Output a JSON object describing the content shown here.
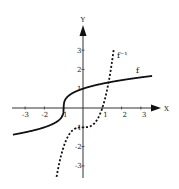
{
  "chart_data": {
    "type": "line",
    "title": "",
    "xlabel": "X",
    "ylabel": "Y",
    "xlim": [
      -3.7,
      3.9
    ],
    "ylim": [
      -3.7,
      4.4
    ],
    "grid": false,
    "x_ticks": [
      -3,
      -2,
      -1,
      1,
      2,
      3
    ],
    "y_ticks": [
      -3,
      -2,
      -1,
      1,
      2,
      3
    ],
    "x_tick_labels": [
      "-3",
      "-2",
      "-1",
      "1",
      "2",
      "3"
    ],
    "y_tick_labels": [
      "-3",
      "-2",
      "-1",
      "1",
      "2",
      "3"
    ],
    "series": [
      {
        "name": "f",
        "label": "f",
        "style": "solid",
        "formula": "cbrt(x + 1)",
        "x_range": [
          -3.63,
          3.58
        ],
        "points": [
          [
            -3.6,
            -1.37
          ],
          [
            -3,
            -1.26
          ],
          [
            -2,
            -1
          ],
          [
            -1.5,
            -0.79
          ],
          [
            -1.1,
            -0.46
          ],
          [
            -1,
            0
          ],
          [
            -0.9,
            0.46
          ],
          [
            -0.5,
            0.79
          ],
          [
            0,
            1
          ],
          [
            1,
            1.26
          ],
          [
            2,
            1.44
          ],
          [
            3,
            1.59
          ],
          [
            3.58,
            1.66
          ]
        ]
      },
      {
        "name": "f_inverse",
        "label": "f⁻¹",
        "style": "dashed",
        "formula": "x^3 - 1",
        "x_range": [
          -1.37,
          1.6
        ],
        "points": [
          [
            -1.37,
            -3.57
          ],
          [
            -1,
            -2
          ],
          [
            -0.5,
            -1.125
          ],
          [
            0,
            -1
          ],
          [
            0.5,
            -0.875
          ],
          [
            1,
            0
          ],
          [
            1.3,
            1.2
          ],
          [
            1.6,
            3.1
          ]
        ]
      }
    ]
  }
}
